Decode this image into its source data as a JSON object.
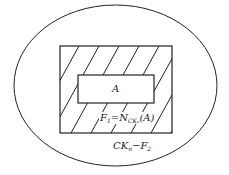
{
  "diagram": {
    "labels": {
      "inner_set": "A",
      "neighborhood_F": "F",
      "neighborhood_F_sub": "1",
      "neighborhood_eq": "=N",
      "neighborhood_N_sub": "CKₙ",
      "neighborhood_arg": "(A)",
      "complement_CK": "CK",
      "complement_CK_sub": "n",
      "complement_minus": "−F",
      "complement_F_sub": "2"
    },
    "colors": {
      "stroke": "#222222",
      "background": "#ffffff"
    }
  }
}
